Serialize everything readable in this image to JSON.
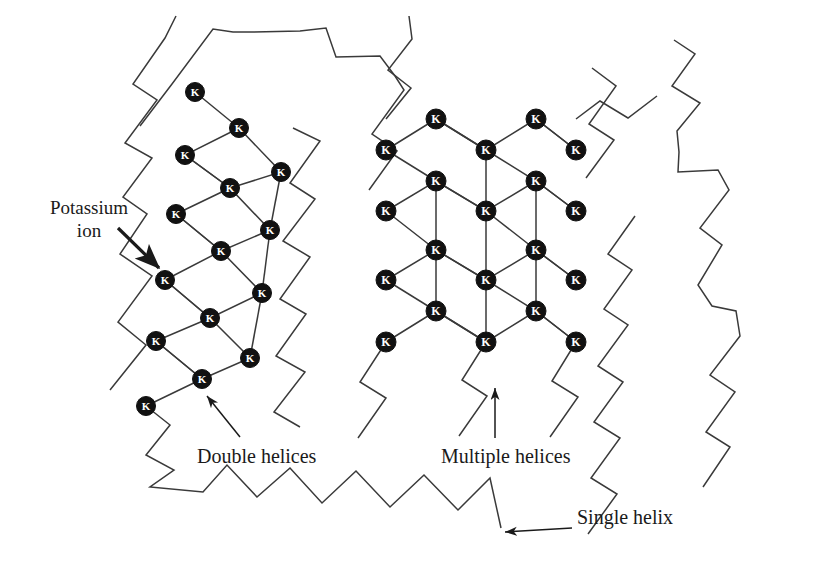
{
  "figure": {
    "background": "#ffffff",
    "line_color": "#3a3a3a",
    "node_fill": "#111111",
    "node_label_color": "#ffffff",
    "text_color": "#1a1a1a",
    "width": 817,
    "height": 574
  },
  "labels": {
    "potassium_ion": "Potassium\nion",
    "potassium_ion_line1": "Potassium",
    "potassium_ion_line2": "ion",
    "double_helices": "Double helices",
    "multiple_helices": "Multiple helices",
    "single_helix": "Single helix"
  },
  "node_glyph": "K",
  "structures": {
    "double_helices": {
      "name": "double-helix-ladder",
      "description": "Two-chain tilted ladder with potassium ions at every chain crossing",
      "node_count": 13,
      "nodes": [
        {
          "x": 195,
          "y": 92
        },
        {
          "x": 239,
          "y": 128
        },
        {
          "x": 185,
          "y": 155
        },
        {
          "x": 230,
          "y": 188
        },
        {
          "x": 281,
          "y": 172
        },
        {
          "x": 176,
          "y": 214
        },
        {
          "x": 221,
          "y": 251
        },
        {
          "x": 270,
          "y": 230
        },
        {
          "x": 165,
          "y": 280
        },
        {
          "x": 210,
          "y": 318
        },
        {
          "x": 262,
          "y": 293
        },
        {
          "x": 156,
          "y": 341
        },
        {
          "x": 202,
          "y": 379
        },
        {
          "x": 250,
          "y": 358
        },
        {
          "x": 146,
          "y": 406
        }
      ]
    },
    "multiple_helices": {
      "name": "multiple-helix-lattice",
      "description": "Diamond lattice network of many chains junctioned by potassium ions",
      "columns_x": [
        386,
        436,
        486,
        536,
        576
      ],
      "rows_y": [
        119,
        150,
        181,
        211,
        250,
        280,
        311,
        342
      ],
      "node_count": 22
    },
    "single_helix": {
      "name": "single-helix-zigzag",
      "description": "Free disordered single chains drawn as zigzag polylines",
      "chain_count": 6
    }
  },
  "annotations": [
    {
      "name": "potassium-ion-arrow",
      "from": [
        118,
        228
      ],
      "to": [
        163,
        271
      ],
      "target": "potassium ion node"
    },
    {
      "name": "double-helices-arrow",
      "from": [
        238,
        436
      ],
      "to": [
        205,
        393
      ],
      "target": "double helix ladder"
    },
    {
      "name": "multiple-helices-arrow",
      "from": [
        495,
        437
      ],
      "to": [
        495,
        385
      ],
      "target": "multiple helix lattice"
    },
    {
      "name": "single-helix-arrow",
      "from": [
        570,
        527
      ],
      "to": [
        503,
        532
      ],
      "target": "single zigzag chain"
    }
  ]
}
